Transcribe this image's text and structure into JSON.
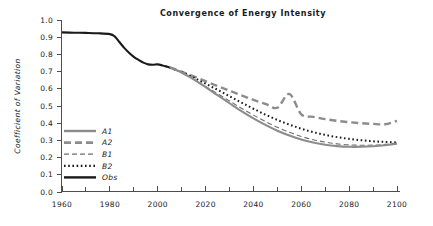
{
  "chart_data": {
    "type": "line",
    "title": "Convergence of Energy Intensity",
    "xlabel": "",
    "ylabel": "Coefficient of Variation",
    "xlim": [
      1960,
      2100
    ],
    "ylim": [
      0.0,
      1.0
    ],
    "grid": false,
    "legend_position": "inside-lower-left",
    "x_ticks": [
      1960,
      1980,
      2000,
      2020,
      2040,
      2060,
      2080,
      2100
    ],
    "x_tick_labels": [
      "1960",
      "1980",
      "2000",
      "2020",
      "2040",
      "2060",
      "2080",
      "2100"
    ],
    "x_minor_ticks": [
      1970,
      1990,
      2010,
      2030,
      2050,
      2070,
      2090
    ],
    "y_ticks": [
      0.0,
      0.1,
      0.2,
      0.3,
      0.4,
      0.5,
      0.6,
      0.7,
      0.8,
      0.9,
      1.0
    ],
    "y_tick_labels": [
      "0.0",
      "0.1",
      "0.2",
      "0.3",
      "0.4",
      "0.5",
      "0.6",
      "0.7",
      "0.8",
      "0.9",
      "1.0"
    ],
    "series": [
      {
        "name": "A1",
        "style": "solid",
        "color": "#8c8c8c",
        "width": 2.1,
        "dash": "",
        "x": [
          2005,
          2010,
          2015,
          2020,
          2025,
          2030,
          2035,
          2040,
          2045,
          2050,
          2055,
          2060,
          2065,
          2070,
          2075,
          2080,
          2085,
          2090,
          2095,
          2100
        ],
        "values": [
          0.725,
          0.695,
          0.655,
          0.61,
          0.563,
          0.516,
          0.47,
          0.428,
          0.39,
          0.356,
          0.328,
          0.305,
          0.288,
          0.275,
          0.267,
          0.263,
          0.263,
          0.266,
          0.272,
          0.281
        ]
      },
      {
        "name": "A2",
        "style": "dashed",
        "color": "#8c8c8c",
        "width": 2.4,
        "dash": "7,4",
        "x": [
          2005,
          2010,
          2015,
          2020,
          2025,
          2030,
          2035,
          2040,
          2045,
          2050,
          2055,
          2060,
          2065,
          2070,
          2075,
          2080,
          2085,
          2090,
          2095,
          2100
        ],
        "values": [
          0.725,
          0.7,
          0.672,
          0.644,
          0.616,
          0.589,
          0.562,
          0.536,
          0.512,
          0.49,
          0.57,
          0.452,
          0.437,
          0.424,
          0.414,
          0.406,
          0.4,
          0.396,
          0.394,
          0.414
        ]
      },
      {
        "name": "B1",
        "style": "dashed-thin",
        "color": "#6e6e6e",
        "width": 1.1,
        "dash": "5,3",
        "x": [
          2005,
          2010,
          2015,
          2020,
          2025,
          2030,
          2035,
          2040,
          2045,
          2050,
          2055,
          2060,
          2065,
          2070,
          2075,
          2080,
          2085,
          2090,
          2095,
          2100
        ],
        "values": [
          0.722,
          0.693,
          0.655,
          0.614,
          0.572,
          0.529,
          0.487,
          0.447,
          0.41,
          0.376,
          0.347,
          0.323,
          0.304,
          0.29,
          0.28,
          0.274,
          0.272,
          0.273,
          0.277,
          0.285
        ]
      },
      {
        "name": "B2",
        "style": "dotted",
        "color": "#1a1a1a",
        "width": 2.0,
        "dash": "1.6,2.6",
        "x": [
          2005,
          2010,
          2015,
          2020,
          2025,
          2030,
          2035,
          2040,
          2045,
          2050,
          2055,
          2060,
          2065,
          2070,
          2075,
          2080,
          2085,
          2090,
          2095,
          2100
        ],
        "values": [
          0.722,
          0.697,
          0.665,
          0.63,
          0.594,
          0.557,
          0.52,
          0.484,
          0.45,
          0.419,
          0.392,
          0.368,
          0.348,
          0.332,
          0.319,
          0.309,
          0.301,
          0.295,
          0.291,
          0.288
        ]
      },
      {
        "name": "Obs",
        "style": "solid",
        "color": "#1a1a1a",
        "width": 2.1,
        "dash": "",
        "x": [
          1960,
          1965,
          1970,
          1975,
          1980,
          1982,
          1984,
          1986,
          1988,
          1990,
          1992,
          1994,
          1996,
          1998,
          2000,
          2002,
          2004,
          2005
        ],
        "values": [
          0.928,
          0.926,
          0.925,
          0.923,
          0.918,
          0.905,
          0.872,
          0.838,
          0.81,
          0.786,
          0.768,
          0.752,
          0.742,
          0.74,
          0.742,
          0.736,
          0.728,
          0.724
        ]
      }
    ],
    "legend_items": [
      {
        "label": "A1",
        "color": "#8c8c8c",
        "dash": "",
        "width": 2.4
      },
      {
        "label": "A2",
        "color": "#8c8c8c",
        "dash": "7,4",
        "width": 2.8
      },
      {
        "label": "B1",
        "color": "#6e6e6e",
        "dash": "5,3",
        "width": 1.2
      },
      {
        "label": "B2",
        "color": "#1a1a1a",
        "dash": "1.6,2.6",
        "width": 2.2
      },
      {
        "label": "Obs",
        "color": "#1a1a1a",
        "dash": "",
        "width": 2.4
      }
    ]
  }
}
